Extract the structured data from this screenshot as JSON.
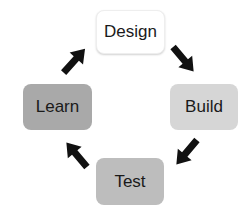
{
  "diagram": {
    "type": "cycle",
    "nodes": [
      {
        "id": "design",
        "label": "Design",
        "color": "#ffffff",
        "x": 96,
        "y": 10,
        "w": 69,
        "h": 44
      },
      {
        "id": "build",
        "label": "Build",
        "color": "#d6d6d6",
        "x": 170,
        "y": 84,
        "w": 68,
        "h": 46
      },
      {
        "id": "test",
        "label": "Test",
        "color": "#bdbdbd",
        "x": 96,
        "y": 158,
        "w": 68,
        "h": 47
      },
      {
        "id": "learn",
        "label": "Learn",
        "color": "#a9a9a9",
        "x": 23,
        "y": 84,
        "w": 69,
        "h": 46
      }
    ],
    "edges": [
      {
        "from": "design",
        "to": "build",
        "direction": "down-right"
      },
      {
        "from": "build",
        "to": "test",
        "direction": "down-left"
      },
      {
        "from": "test",
        "to": "learn",
        "direction": "up-left"
      },
      {
        "from": "learn",
        "to": "design",
        "direction": "up-right"
      }
    ],
    "arrow_color": "#111111"
  }
}
